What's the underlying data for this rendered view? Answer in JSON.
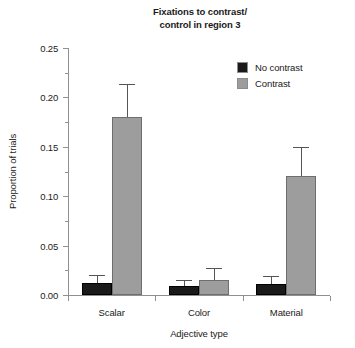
{
  "chart_data": {
    "type": "bar",
    "title": "Fixations to contrast/\ncontrol in region 3",
    "xlabel": "Adjective type",
    "ylabel": "Proportion of trials",
    "categories": [
      "Scalar",
      "Color",
      "Material"
    ],
    "ylim": [
      0.0,
      0.25
    ],
    "ytick_labels": [
      "0.00",
      "0.05",
      "0.10",
      "0.15",
      "0.20",
      "0.25"
    ],
    "ytick_values": [
      0.0,
      0.05,
      0.1,
      0.15,
      0.2,
      0.25
    ],
    "yminor_tick_values": [
      0.025,
      0.075,
      0.125,
      0.175,
      0.225
    ],
    "grid": false,
    "legend_position": "top-right",
    "series": [
      {
        "name": "No contrast",
        "color": "#1a1a1a",
        "values": [
          0.012,
          0.009,
          0.011
        ],
        "errors": [
          0.008,
          0.006,
          0.008
        ]
      },
      {
        "name": "Contrast",
        "color": "#9d9d9d",
        "values": [
          0.18,
          0.015,
          0.12
        ],
        "errors": [
          0.034,
          0.012,
          0.03
        ]
      }
    ]
  },
  "legend": {
    "items": [
      {
        "label": "No contrast",
        "color": "#1a1a1a"
      },
      {
        "label": "Contrast",
        "color": "#9d9d9d"
      }
    ]
  }
}
